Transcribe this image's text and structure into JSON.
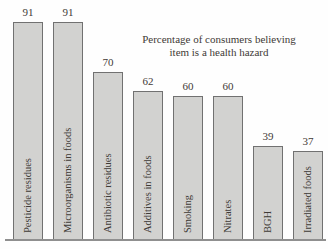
{
  "chart_data": {
    "type": "bar",
    "title": "Percentage of consumers believing item is a health hazard",
    "title_lines": [
      "Percentage of consumers believing",
      "item is a health hazard"
    ],
    "categories": [
      "Pesticide residues",
      "Microorganisms in foods",
      "Antibiotic residues",
      "Additives in foods",
      "Smoking",
      "Nitrates",
      "BGH",
      "Irradiated foods"
    ],
    "values": [
      91,
      91,
      70,
      62,
      60,
      60,
      39,
      37
    ],
    "value_labels_shown": true,
    "category_label_position": "inside-bar-rotated-90",
    "xlabel": "",
    "ylabel": "",
    "ylim": [
      0,
      100
    ],
    "grid": false,
    "legend_position": "none",
    "colors": {
      "bar_fill": "#d2d2d0",
      "bar_border": "#717171",
      "axis_line": "#8f8f8f",
      "text": "#3e3a36",
      "background": "#fefefe"
    }
  }
}
